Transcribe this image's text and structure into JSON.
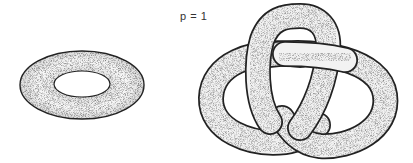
{
  "figure": {
    "label": "p = 1",
    "shapes": [
      {
        "name": "torus",
        "description": "genus-1 torus surface, stippled shading"
      },
      {
        "name": "trefoil-knot-tube",
        "description": "tubular neighborhood of a trefoil knot, stippled shading"
      }
    ],
    "colors": {
      "outline": "#222222",
      "fill": "#f4f4f4",
      "shade": "#9a9a9a"
    }
  }
}
